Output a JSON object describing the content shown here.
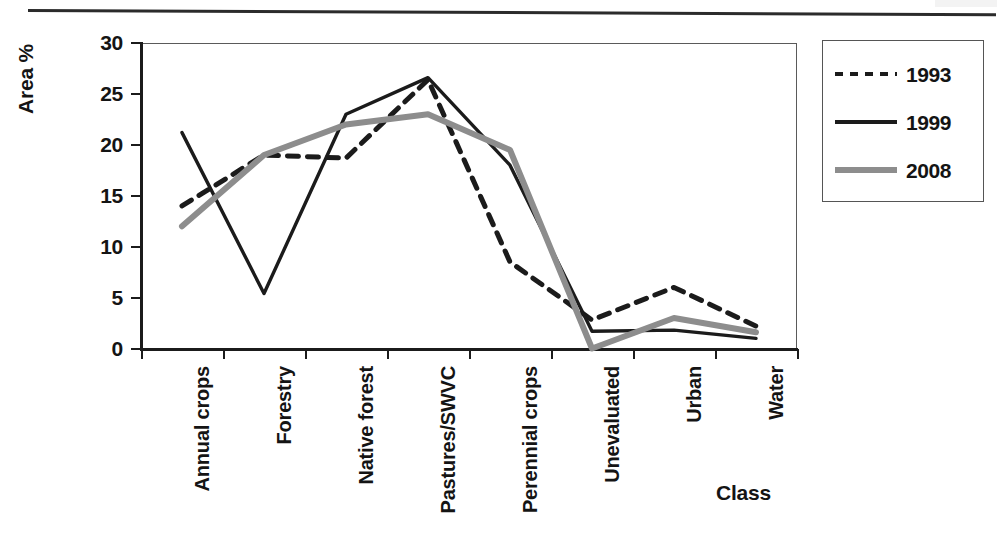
{
  "page": {
    "has_top_rule": true
  },
  "chart_data": {
    "type": "line",
    "title": "",
    "xlabel": "Class",
    "ylabel": "Area %",
    "ylim": [
      0,
      30
    ],
    "yticks": [
      0,
      5,
      10,
      15,
      20,
      25,
      30
    ],
    "ytick_labels": [
      "0",
      "5",
      "10",
      "15",
      "20",
      "25",
      "30"
    ],
    "grid": false,
    "legend_position": "right",
    "categories": [
      "Annual crops",
      "Forestry",
      "Native forest",
      "Pastures/SWVC",
      "Perennial crops",
      "Unevaluated",
      "Urban",
      "Water"
    ],
    "series": [
      {
        "name": "1993",
        "style": "dashed",
        "color": "#1b1b1b",
        "values": [
          14.0,
          19.0,
          18.7,
          26.4,
          8.5,
          2.8,
          6.0,
          2.2
        ]
      },
      {
        "name": "1999",
        "style": "solid",
        "color": "#1b1b1b",
        "values": [
          21.2,
          5.4,
          23.0,
          26.6,
          18.0,
          1.7,
          1.8,
          1.0
        ]
      },
      {
        "name": "2008",
        "style": "solid-gray",
        "color": "#8d8d8d",
        "values": [
          12.0,
          19.0,
          22.0,
          23.0,
          19.5,
          0.0,
          3.0,
          1.6
        ]
      }
    ]
  },
  "legend": {
    "entries": [
      {
        "label": "1993",
        "swatch": "dashed-line-swatch"
      },
      {
        "label": "1999",
        "swatch": "solid-line-swatch"
      },
      {
        "label": "2008",
        "swatch": "gray-line-swatch"
      }
    ]
  }
}
